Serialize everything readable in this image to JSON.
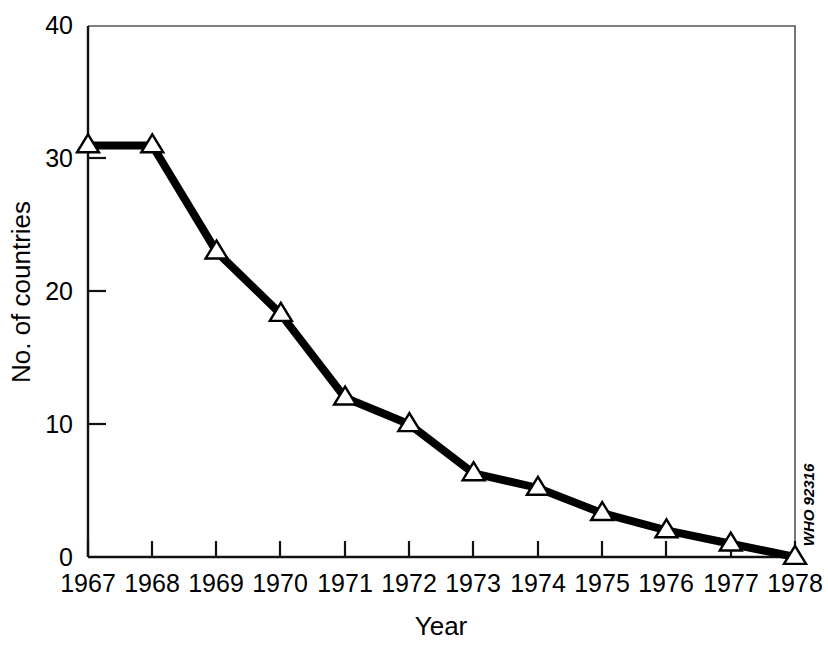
{
  "chart_data": {
    "type": "line",
    "title": "",
    "subtitle": "",
    "xlabel": "Year",
    "ylabel": "No. of countries",
    "categories": [
      "1967",
      "1968",
      "1969",
      "1970",
      "1971",
      "1972",
      "1973",
      "1974",
      "1975",
      "1976",
      "1977",
      "1978"
    ],
    "values": [
      31,
      31,
      23,
      18.3,
      12,
      10,
      6.3,
      5.2,
      3.3,
      2,
      1,
      0
    ],
    "series": [
      {
        "name": "No. of countries",
        "values": [
          31,
          31,
          23,
          18.3,
          12,
          10,
          6.3,
          5.2,
          3.3,
          2,
          1,
          0
        ]
      }
    ],
    "xlim": [
      1967,
      1978
    ],
    "ylim": [
      0,
      40
    ],
    "ytick_labels": [
      "0",
      "10",
      "20",
      "30",
      "40"
    ],
    "ytick_values": [
      0,
      10,
      20,
      30,
      40
    ],
    "xtick_labels": [
      "1967",
      "1968",
      "1969",
      "1970",
      "1971",
      "1972",
      "1973",
      "1974",
      "1975",
      "1976",
      "1977",
      "1978"
    ],
    "grid": false,
    "legend": false,
    "legend_position": "none",
    "marker": "open-triangle",
    "line_color": "#000000",
    "marker_fill": "#ffffff",
    "marker_edge_color": "#000000",
    "background_color": "#ffffff",
    "annotations": [
      {
        "text": "WHO 92316",
        "position": "right-edge-vertical",
        "rotation": -90
      }
    ]
  },
  "axes": {
    "y_label": "No. of countries",
    "x_label": "Year",
    "y_ticks": [
      {
        "label": "40",
        "value": 40
      },
      {
        "label": "30",
        "value": 30
      },
      {
        "label": "20",
        "value": 20
      },
      {
        "label": "10",
        "value": 10
      },
      {
        "label": "0",
        "value": 0
      }
    ],
    "x_ticks": [
      {
        "label": "1967",
        "value": 1967
      },
      {
        "label": "1968",
        "value": 1968
      },
      {
        "label": "1969",
        "value": 1969
      },
      {
        "label": "1970",
        "value": 1970
      },
      {
        "label": "1971",
        "value": 1971
      },
      {
        "label": "1972",
        "value": 1972
      },
      {
        "label": "1973",
        "value": 1973
      },
      {
        "label": "1974",
        "value": 1974
      },
      {
        "label": "1975",
        "value": 1975
      },
      {
        "label": "1976",
        "value": 1976
      },
      {
        "label": "1977",
        "value": 1977
      },
      {
        "label": "1978",
        "value": 1978
      }
    ]
  },
  "credit": {
    "text": "WHO 92316"
  }
}
